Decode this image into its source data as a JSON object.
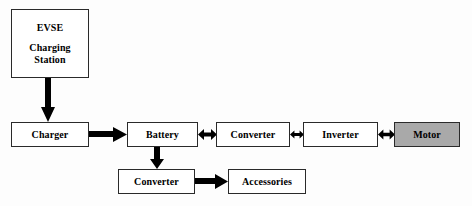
{
  "diagram": {
    "background_color": "#fdfdfd",
    "box_fill_default": "#ffffff",
    "box_fill_shaded": "#a9a9a9",
    "line_color": "#000000",
    "nodes": [
      {
        "id": "evse",
        "label_lines": [
          "EVSE",
          "Charging",
          "Station"
        ],
        "line1": "EVSE",
        "line2": "Charging",
        "line3": "Station",
        "shaded": false
      },
      {
        "id": "charger",
        "label": "Charger",
        "shaded": false
      },
      {
        "id": "battery",
        "label": "Battery",
        "shaded": false
      },
      {
        "id": "converter_hv",
        "label": "Converter",
        "shaded": false
      },
      {
        "id": "inverter",
        "label": "Inverter",
        "shaded": false
      },
      {
        "id": "motor",
        "label": "Motor",
        "shaded": true
      },
      {
        "id": "converter_lv",
        "label": "Converter",
        "shaded": false
      },
      {
        "id": "accessories",
        "label": "Accessories",
        "shaded": false
      }
    ],
    "connectors": [
      {
        "id": "evse-to-charger",
        "from": "evse",
        "to": "charger",
        "direction": "down",
        "style": "thick-solid"
      },
      {
        "id": "charger-to-battery",
        "from": "charger",
        "to": "battery",
        "direction": "right",
        "style": "thick-solid"
      },
      {
        "id": "battery-to-converter-hv",
        "from": "battery",
        "to": "converter_hv",
        "direction": "bidirectional",
        "style": "thick-solid"
      },
      {
        "id": "converter-hv-to-inverter",
        "from": "converter_hv",
        "to": "inverter",
        "direction": "bidirectional",
        "style": "thick-solid"
      },
      {
        "id": "inverter-to-motor",
        "from": "inverter",
        "to": "motor",
        "direction": "bidirectional",
        "style": "thick-solid"
      },
      {
        "id": "battery-to-converter-lv",
        "from": "battery",
        "to": "converter_lv",
        "direction": "down",
        "style": "thick-solid"
      },
      {
        "id": "converter-lv-to-accessories",
        "from": "converter_lv",
        "to": "accessories",
        "direction": "right",
        "style": "thick-solid"
      }
    ]
  }
}
